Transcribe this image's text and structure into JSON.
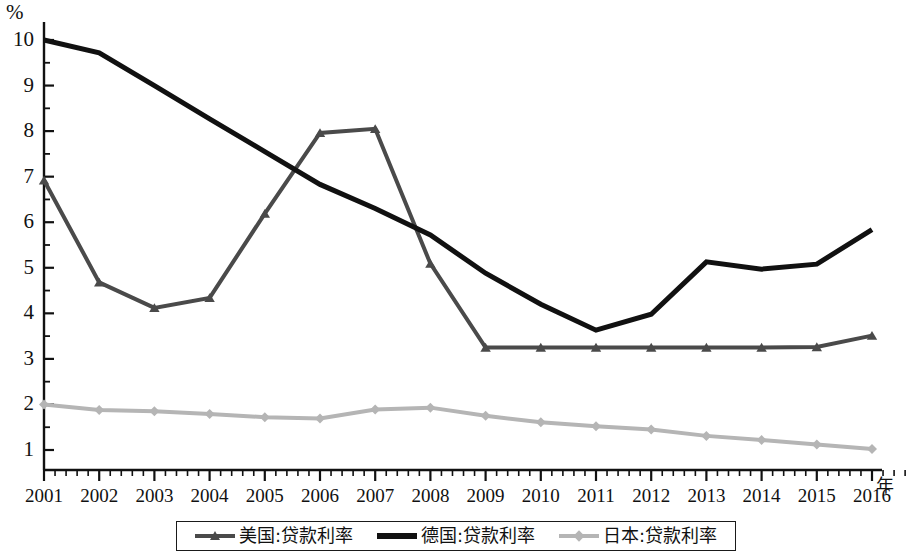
{
  "axes": {
    "y_unit_label": "%",
    "x_unit_label": "年",
    "y_ticks": [
      "1",
      "2",
      "3",
      "4",
      "5",
      "6",
      "7",
      "8",
      "9",
      "10"
    ],
    "x_ticks": [
      "2001",
      "2002",
      "2003",
      "2004",
      "2005",
      "2006",
      "2007",
      "2008",
      "2009",
      "2010",
      "2011",
      "2012",
      "2013",
      "2014",
      "2015",
      "2016"
    ]
  },
  "legend": {
    "items": [
      {
        "label": "美国:贷款利率",
        "color": "#4a4a4a",
        "marker": "triangle"
      },
      {
        "label": "德国:贷款利率",
        "color": "#111111",
        "marker": "none"
      },
      {
        "label": "日本:贷款利率",
        "color": "#b5b5b5",
        "marker": "diamond"
      }
    ]
  },
  "chart_data": {
    "type": "line",
    "title": "",
    "subtitle": "",
    "xlabel": "年",
    "ylabel": "%",
    "xlim": [
      2001,
      2016
    ],
    "ylim": [
      0.5,
      10.25
    ],
    "grid": false,
    "legend_position": "bottom",
    "annotations": [],
    "categories": [
      2001,
      2002,
      2003,
      2004,
      2005,
      2006,
      2007,
      2008,
      2009,
      2010,
      2011,
      2012,
      2013,
      2014,
      2015,
      2016
    ],
    "tick_labels": {
      "x": [
        "2001",
        "2002",
        "2003",
        "2004",
        "2005",
        "2006",
        "2007",
        "2008",
        "2009",
        "2010",
        "2011",
        "2012",
        "2013",
        "2014",
        "2015",
        "2016"
      ],
      "y": [
        "1",
        "2",
        "3",
        "4",
        "5",
        "6",
        "7",
        "8",
        "9",
        "10"
      ]
    },
    "y_minor_tick_interval": 0.5,
    "series": [
      {
        "name": "美国:贷款利率",
        "color": "#4a4a4a",
        "marker": "triangle",
        "line_width": 4,
        "values": [
          6.92,
          4.68,
          4.12,
          4.34,
          6.19,
          7.96,
          8.05,
          5.09,
          3.25,
          3.25,
          3.25,
          3.25,
          3.25,
          3.25,
          3.26,
          3.51
        ]
      },
      {
        "name": "德国:贷款利率",
        "color": "#111111",
        "marker": "none",
        "line_width": 5,
        "values": [
          10.0,
          9.72,
          9.0,
          8.27,
          7.55,
          6.83,
          6.3,
          5.72,
          4.88,
          4.2,
          3.63,
          3.98,
          5.13,
          4.97,
          5.08,
          5.84
        ]
      },
      {
        "name": "日本:贷款利率",
        "color": "#b5b5b5",
        "marker": "diamond",
        "line_width": 4,
        "values": [
          2.0,
          1.88,
          1.85,
          1.79,
          1.72,
          1.69,
          1.89,
          1.93,
          1.75,
          1.61,
          1.52,
          1.45,
          1.31,
          1.22,
          1.12,
          1.02
        ]
      }
    ]
  }
}
